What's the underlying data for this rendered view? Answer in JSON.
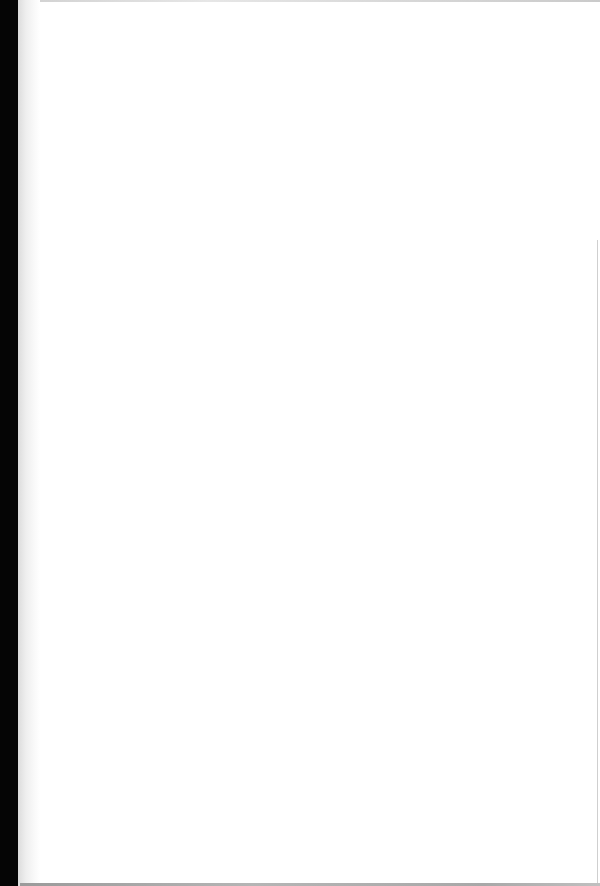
{
  "document": {
    "type": "scanned-page",
    "content": "",
    "colors": {
      "page_background": "#ffffff",
      "scan_edge": "#050505",
      "gutter_shadow": "#dcdcdc"
    }
  }
}
